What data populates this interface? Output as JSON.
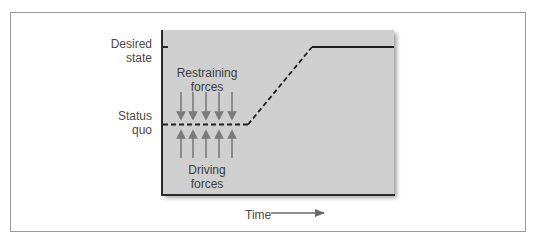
{
  "diagram": {
    "type": "force-field-analysis",
    "y_labels": {
      "desired_state": "Desired\nstate",
      "desired_state_line1": "Desired",
      "desired_state_line2": "state",
      "status_quo_line1": "Status",
      "status_quo_line2": "quo"
    },
    "plot_labels": {
      "restraining_line1": "Restraining",
      "restraining_line2": "forces",
      "driving_line1": "Driving",
      "driving_line2": "forces"
    },
    "x_label": "Time",
    "arrow_counts": {
      "restraining": 5,
      "driving": 5
    },
    "colors": {
      "plot_background": "#cfcfcf",
      "axis": "#2a2a2a",
      "arrows": "#7a7a7a",
      "line": "#1e1e1e",
      "frame": "#9a9a9a"
    },
    "path": {
      "status_quo_segment": "dashed, flat",
      "transition_segment": "dashed, rising",
      "desired_state_segment": "solid, flat"
    }
  }
}
